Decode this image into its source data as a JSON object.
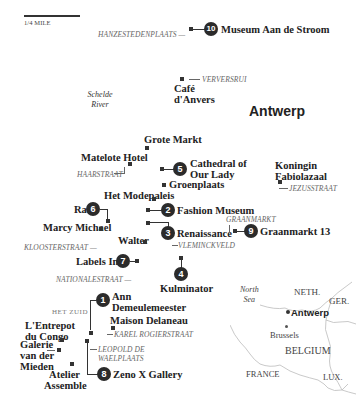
{
  "scale": {
    "label": "1/4 MILE"
  },
  "city": {
    "label": "Antwerp"
  },
  "river": {
    "line1": "Schelde",
    "line2": "River"
  },
  "district": {
    "label": "HET ZUID"
  },
  "streets": {
    "hanzestedenplaats": "HANZESTEDENPLAATS —",
    "verversrui": "VERVERSRUI",
    "haarstraat": "HAARSTRAAT",
    "jezusstraat": "JEZUSSTRAAT",
    "graanmarkt": "GRAANMARKT",
    "vleminckveld": "VLEMINCKVELD",
    "kloosterstraat": "KLOOSTERSTRAAT —",
    "nationalestraat": "NATIONALESTRAAT —",
    "karel_rogierstraat": "KAREL ROGIERSTRAAT",
    "leopold_line1": "LEOPOLD DE",
    "leopold_line2": "WAELPLAATS"
  },
  "numbered_places": [
    {
      "number": "1",
      "name_line1": "Ann",
      "name_line2": "Demeulemeester"
    },
    {
      "number": "2",
      "name": "Fashion Museum"
    },
    {
      "number": "3",
      "name": "Renaissance"
    },
    {
      "number": "4",
      "name": "Kulminator"
    },
    {
      "number": "5",
      "name_line1": "Cathedral of",
      "name_line2": "Our Lady"
    },
    {
      "number": "6",
      "name": "Ra"
    },
    {
      "number": "7",
      "name": "Labels Inc."
    },
    {
      "number": "8",
      "name": "Zeno X Gallery"
    },
    {
      "number": "9",
      "name": "Graanmarkt 13"
    },
    {
      "number": "10",
      "name": "Museum Aan de Stroom"
    }
  ],
  "other_places": {
    "cafe_line1": "Café",
    "cafe_line2": "d'Anvers",
    "grote_markt": "Grote Markt",
    "matelote": "Matelote Hotel",
    "groenplaats": "Groenplaats",
    "modepaleis": "Het Modepaleis",
    "marcy": "Marcy Michael",
    "walter": "Walter",
    "koningin_line1": "Koningin",
    "koningin_line2": "Fabiolazaal",
    "maison": "Maison Delaneau",
    "entrepot_line1": "L'Entrepot",
    "entrepot_line2": "du Congo",
    "galerie_line1": "Galerie",
    "galerie_line2": "van der",
    "galerie_line3": "Mieden",
    "atelier_line1": "Atelier",
    "atelier_line2": "Assemble"
  },
  "inset": {
    "north_sea_line1": "North",
    "north_sea_line2": "Sea",
    "neth": "NETH.",
    "ger": "GER.",
    "antwerp": "Antwerp",
    "brussels": "Brussels",
    "belgium": "BELGIUM",
    "france": "FRANCE",
    "lux": "LUX."
  },
  "colors": {
    "marker": "#2b2b2b",
    "street": "#666666",
    "border": "#bbbbbb"
  }
}
